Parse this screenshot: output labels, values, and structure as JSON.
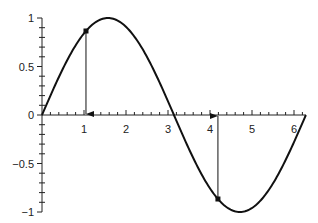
{
  "chart_data": {
    "type": "line",
    "title": "",
    "xlabel": "",
    "ylabel": "",
    "xlim": [
      0,
      6.2832
    ],
    "ylim": [
      -1,
      1
    ],
    "grid": false,
    "legend": null,
    "x_ticks": [
      1,
      2,
      3,
      4,
      5,
      6
    ],
    "x_tick_labels": [
      "1",
      "2",
      "3",
      "4",
      "5",
      "6"
    ],
    "y_ticks": [
      1,
      0.5,
      0,
      -0.5,
      -1
    ],
    "y_tick_labels": [
      "1",
      "0.5",
      "0",
      "−0.5",
      "−1"
    ],
    "series": [
      {
        "name": "sin(x)",
        "function": "sin",
        "x": [
          0,
          0.5236,
          1.0472,
          1.5708,
          2.0944,
          2.618,
          3.1416,
          3.6652,
          4.1888,
          4.7124,
          5.236,
          5.7596,
          6.2832
        ],
        "values": [
          0,
          0.5,
          0.866,
          1,
          0.866,
          0.5,
          0,
          -0.5,
          -0.866,
          -1,
          -0.866,
          -0.5,
          0
        ]
      }
    ],
    "annotations": [
      {
        "type": "point-arrow",
        "x": 1.0472,
        "y": 0.866,
        "direction": "down-to-axis"
      },
      {
        "type": "point-arrow",
        "x": 4.1888,
        "y": -0.866,
        "direction": "up-to-axis"
      }
    ]
  }
}
